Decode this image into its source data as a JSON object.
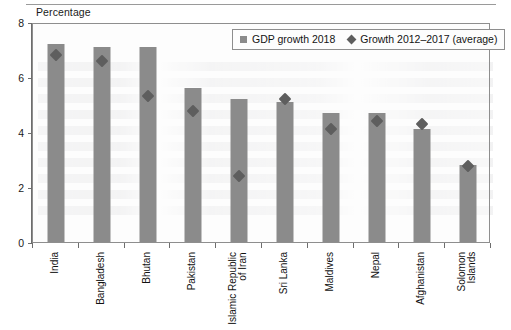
{
  "axis_title": "Percentage",
  "legend": {
    "items": [
      {
        "label": "GDP growth 2018",
        "marker": "square-marker",
        "color": "#8b8b8b"
      },
      {
        "label": "Growth 2012–2017 (average)",
        "marker": "diamond-marker",
        "color": "#5e5e5e"
      }
    ]
  },
  "chart_data": {
    "type": "bar",
    "title": "",
    "subtitle": "",
    "xlabel": "",
    "ylabel": "Percentage",
    "ylim": [
      0,
      8
    ],
    "yticks": [
      0,
      2,
      4,
      6,
      8
    ],
    "ytick_labels": [
      "0",
      "2",
      "4",
      "6",
      "8"
    ],
    "grid": false,
    "legend_position": "top-right",
    "categories": [
      "India",
      "Bangladesh",
      "Bhutan",
      "Pakistan",
      "Islamic Republic\nof Iran",
      "Sri Lanka",
      "Maldives",
      "Nepal",
      "Afghanistan",
      "Solomon\nIslands"
    ],
    "series": [
      {
        "name": "GDP growth 2018",
        "type": "bar",
        "color": "#8b8b8b",
        "values": [
          7.2,
          7.1,
          7.1,
          5.6,
          5.2,
          5.1,
          4.7,
          4.7,
          4.1,
          2.8
        ]
      },
      {
        "name": "Growth 2012–2017 (average)",
        "type": "scatter",
        "color": "#5e5e5e",
        "values": [
          6.8,
          6.6,
          5.3,
          4.75,
          2.4,
          5.2,
          4.1,
          4.4,
          4.3,
          2.75
        ]
      }
    ]
  }
}
